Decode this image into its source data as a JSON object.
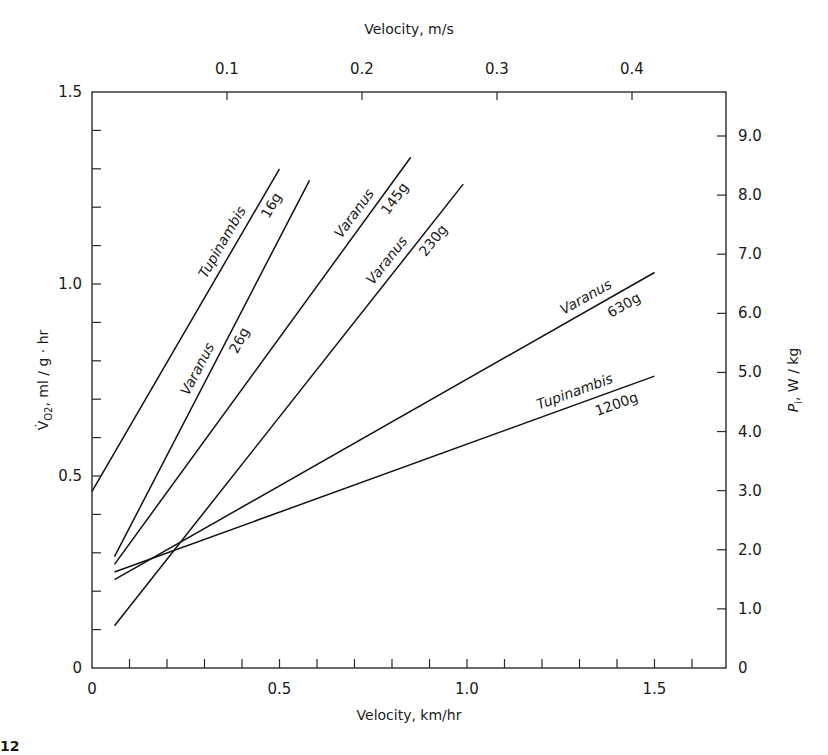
{
  "chart_data": {
    "type": "line",
    "title": "",
    "xlabel": "Velocity, km/hr",
    "x2label": "Velocity, m/s",
    "ylabel": "V̇O2, ml/g·hr",
    "y2label": "Pi, W / kg",
    "xlim": [
      0,
      1.7
    ],
    "ylim": [
      0,
      1.5
    ],
    "x_ticks": [
      0,
      0.5,
      1.0,
      1.5
    ],
    "x_tick_labels": [
      "0",
      "0.5",
      "1.0",
      "1.5"
    ],
    "x_minor_step": 0.1,
    "x2_ticks_ms": [
      0.1,
      0.2,
      0.3,
      0.4
    ],
    "x2_tick_labels": [
      "0.1",
      "0.2",
      "0.3",
      "0.4"
    ],
    "y_ticks": [
      0,
      0.5,
      1.0,
      1.5
    ],
    "y_tick_labels": [
      "0",
      "0.5",
      "1.0",
      "1.5"
    ],
    "y_minor_step": 0.1,
    "y2_ticks": [
      0,
      1,
      2,
      3,
      4,
      5,
      6,
      7,
      8,
      9
    ],
    "y2_tick_labels": [
      "0",
      "1.0",
      "2.0",
      "3.0",
      "4.0",
      "5.0",
      "6.0",
      "7.0",
      "8.0",
      "9.0"
    ],
    "grid": false,
    "legend": "inline labels on lines",
    "series": [
      {
        "name": "Tupinambis 16g",
        "genus": "Tupinambis",
        "mass": "16g",
        "x": [
          0.0,
          0.5
        ],
        "y": [
          0.46,
          1.3
        ]
      },
      {
        "name": "Varanus 26g",
        "genus": "Varanus",
        "mass": "26g",
        "x": [
          0.06,
          0.58
        ],
        "y": [
          0.29,
          1.27
        ]
      },
      {
        "name": "Varanus 145g",
        "genus": "Varanus",
        "mass": "145g",
        "x": [
          0.06,
          0.85
        ],
        "y": [
          0.27,
          1.33
        ]
      },
      {
        "name": "Varanus 230g",
        "genus": "Varanus",
        "mass": "230g",
        "x": [
          0.06,
          0.99
        ],
        "y": [
          0.11,
          1.26
        ]
      },
      {
        "name": "Varanus 630g",
        "genus": "Varanus",
        "mass": "630g",
        "x": [
          0.06,
          1.5
        ],
        "y": [
          0.23,
          1.03
        ]
      },
      {
        "name": "Tupinambis 1200g",
        "genus": "Tupinambis",
        "mass": "1200g",
        "x": [
          0.06,
          1.5
        ],
        "y": [
          0.25,
          0.76
        ]
      }
    ]
  },
  "labels": {
    "xlabel": "Velocity, km/hr",
    "x2label": "Velocity, m/s",
    "ylabel_main": "V̇",
    "ylabel_sub": "O2",
    "ylabel_rest": ", ml / g · hr",
    "y2label_main": "P",
    "y2label_sub": "i",
    "y2label_rest": ", W / kg",
    "fig_fragment": "12"
  }
}
